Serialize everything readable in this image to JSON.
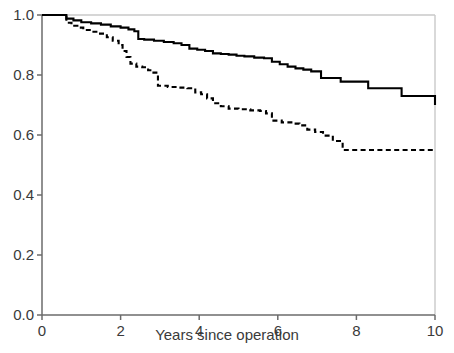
{
  "chart_data": {
    "type": "line",
    "title": "",
    "subtitle": "",
    "xlabel": "Years since operation",
    "ylabel": "",
    "xlim": [
      0,
      10
    ],
    "ylim": [
      0.0,
      1.0
    ],
    "xticks": [
      "0",
      "2",
      "4",
      "6",
      "8",
      "10"
    ],
    "xtick_values": [
      0,
      2,
      4,
      6,
      8,
      10
    ],
    "yticks": [
      "0.0",
      "0.2",
      "0.4",
      "0.6",
      "0.8",
      "1.0"
    ],
    "ytick_values": [
      0.0,
      0.2,
      0.4,
      0.6,
      0.8,
      1.0
    ],
    "grid": false,
    "legend": "none",
    "annotations": [],
    "step_type": "post",
    "series": [
      {
        "name": "solid-curve",
        "style": "solid",
        "color": "#000000",
        "final_value": 0.7,
        "x": [
          0.0,
          0.45,
          0.62,
          0.8,
          1.0,
          1.25,
          1.5,
          1.75,
          2.0,
          2.2,
          2.35,
          2.45,
          2.6,
          2.85,
          3.1,
          3.35,
          3.55,
          3.75,
          3.95,
          4.15,
          4.35,
          4.55,
          4.75,
          4.95,
          5.15,
          5.4,
          5.65,
          5.85,
          6.05,
          6.25,
          6.45,
          6.65,
          6.85,
          7.1,
          7.6,
          8.3,
          9.15,
          10.0
        ],
        "y": [
          1.0,
          1.0,
          0.988,
          0.982,
          0.976,
          0.972,
          0.968,
          0.962,
          0.958,
          0.952,
          0.946,
          0.92,
          0.918,
          0.914,
          0.91,
          0.906,
          0.9,
          0.888,
          0.884,
          0.88,
          0.872,
          0.87,
          0.868,
          0.864,
          0.862,
          0.858,
          0.856,
          0.844,
          0.836,
          0.828,
          0.822,
          0.818,
          0.812,
          0.79,
          0.778,
          0.756,
          0.73,
          0.7
        ]
      },
      {
        "name": "dashed-curve",
        "style": "dashed",
        "color": "#000000",
        "final_value": 0.55,
        "x": [
          0.0,
          0.5,
          0.62,
          0.75,
          0.9,
          1.05,
          1.25,
          1.45,
          1.65,
          1.8,
          1.95,
          2.05,
          2.15,
          2.25,
          2.4,
          2.55,
          2.7,
          2.8,
          2.95,
          3.2,
          3.45,
          3.7,
          3.9,
          4.05,
          4.2,
          4.35,
          4.55,
          4.75,
          5.0,
          5.3,
          5.55,
          5.7,
          5.85,
          6.1,
          6.4,
          6.55,
          6.75,
          6.95,
          7.15,
          7.4,
          7.65,
          8.2,
          9.0,
          10.0
        ],
        "y": [
          1.0,
          1.0,
          0.974,
          0.964,
          0.958,
          0.95,
          0.944,
          0.938,
          0.926,
          0.914,
          0.9,
          0.88,
          0.86,
          0.838,
          0.828,
          0.826,
          0.816,
          0.808,
          0.764,
          0.76,
          0.758,
          0.756,
          0.742,
          0.736,
          0.722,
          0.706,
          0.696,
          0.688,
          0.686,
          0.682,
          0.68,
          0.672,
          0.648,
          0.642,
          0.638,
          0.632,
          0.618,
          0.61,
          0.598,
          0.58,
          0.55,
          0.55,
          0.55,
          0.55
        ]
      }
    ]
  },
  "axis": {
    "x_label": "Years since operation"
  },
  "style": {
    "axis_color": "#555555",
    "frame_color": "#c9c9c9",
    "curve_color": "#000000",
    "text_color": "#3a3a3a",
    "background": "#ffffff"
  }
}
